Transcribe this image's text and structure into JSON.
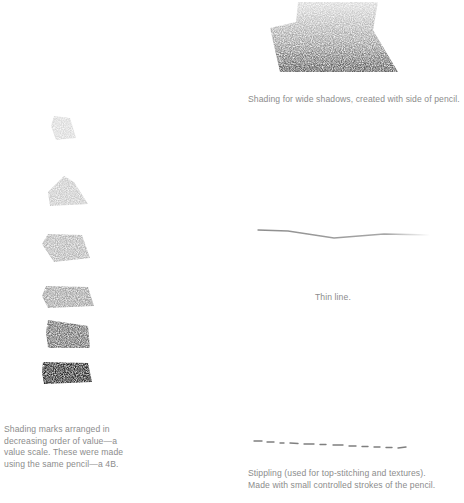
{
  "captions": {
    "wide_shadows": "Shading for wide shadows, created with side of pencil.",
    "thin_line": "Thin line.",
    "value_scale": [
      "Shading marks arranged in",
      "decreasing order of value—a",
      "value scale. These were made",
      "using the same pencil—a 4B."
    ],
    "stippling": [
      "Stippling (used for top-stitching and textures).",
      "Made with small controlled strokes of the pencil."
    ]
  },
  "illustrations": {
    "value_scale_swatches": [
      {
        "label": "lightest",
        "color": "#e2e2e2"
      },
      {
        "label": "very-light",
        "color": "#d2d2d2"
      },
      {
        "label": "light",
        "color": "#bcbcbc"
      },
      {
        "label": "medium",
        "color": "#a4a4a4"
      },
      {
        "label": "dark",
        "color": "#6e6e6e"
      },
      {
        "label": "darkest",
        "color": "#2a2a2a"
      }
    ],
    "pencil_stroke_color": "#9a9a9a"
  }
}
